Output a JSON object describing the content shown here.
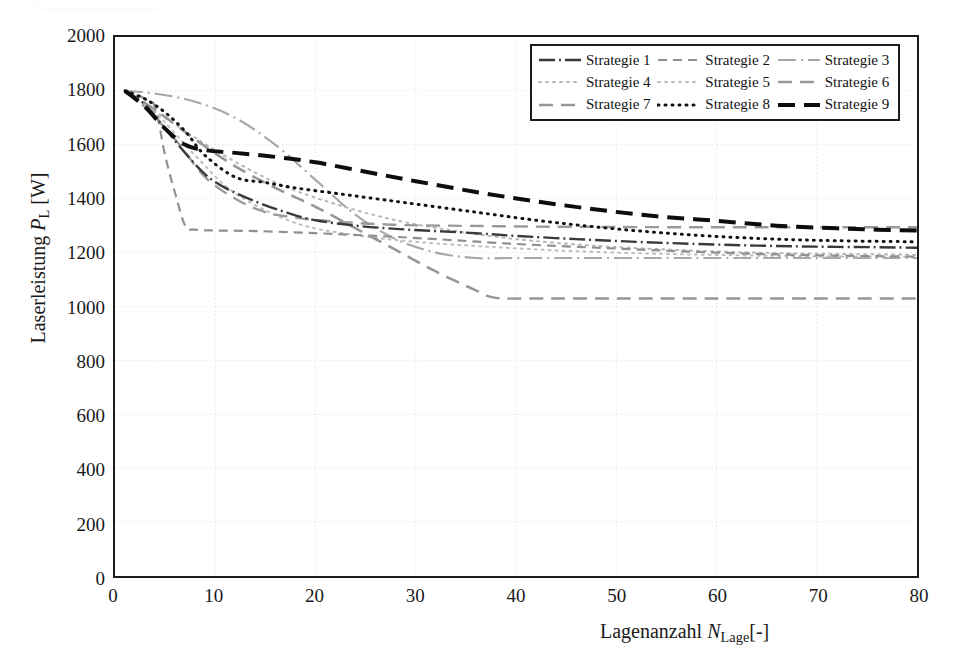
{
  "axes": {
    "y_title_prefix": "Laserleistung ",
    "y_title_symbol": "P",
    "y_title_sub": "L",
    "y_title_suffix": " [W]",
    "x_title_prefix": "Lagenanzahl ",
    "x_title_symbol": "N",
    "x_title_sub": "Lage",
    "x_title_suffix": "[-]",
    "y_ticks": [
      "2000",
      "1800",
      "1600",
      "1400",
      "1200",
      "1000",
      "800",
      "600",
      "400",
      "200",
      "0"
    ],
    "x_ticks": [
      "0",
      "10",
      "20",
      "30",
      "40",
      "50",
      "60",
      "70",
      "80"
    ]
  },
  "legend": {
    "items": [
      {
        "label": "Strategie 1",
        "key": "s1"
      },
      {
        "label": "Strategie 2",
        "key": "s2"
      },
      {
        "label": "Strategie 3",
        "key": "s3"
      },
      {
        "label": "Strategie 4",
        "key": "s4"
      },
      {
        "label": "Strategie 5",
        "key": "s5"
      },
      {
        "label": "Strategie 6",
        "key": "s6"
      },
      {
        "label": "Strategie 7",
        "key": "s7"
      },
      {
        "label": "Strategie 8",
        "key": "s8"
      },
      {
        "label": "Strategie 9",
        "key": "s9"
      }
    ]
  },
  "chart_data": {
    "type": "line",
    "title": "",
    "xlabel": "Lagenanzahl N_Lage [-]",
    "ylabel": "Laserleistung P_L [W]",
    "xlim": [
      0,
      80
    ],
    "ylim": [
      0,
      2000
    ],
    "xticks": [
      0,
      10,
      20,
      30,
      40,
      50,
      60,
      70,
      80
    ],
    "yticks": [
      0,
      200,
      400,
      600,
      800,
      1000,
      1200,
      1400,
      1600,
      1800,
      2000
    ],
    "grid": "dotted-light",
    "legend_position": "top-right-inside",
    "series": [
      {
        "name": "Strategie 1",
        "style": "dash-dot",
        "color": "#3a3a3a",
        "width": 2.4,
        "x": [
          1,
          3,
          5,
          7,
          9,
          11,
          14,
          17,
          20,
          24,
          28,
          32,
          36,
          40,
          46,
          52,
          58,
          64,
          70,
          76,
          80
        ],
        "y": [
          1800,
          1750,
          1660,
          1570,
          1490,
          1440,
          1390,
          1350,
          1320,
          1300,
          1288,
          1280,
          1272,
          1262,
          1250,
          1240,
          1232,
          1226,
          1222,
          1220,
          1218
        ]
      },
      {
        "name": "Strategie 2",
        "style": "dashed",
        "color": "#8f8f8f",
        "width": 2.2,
        "x": [
          1,
          2,
          3,
          4,
          5,
          6,
          7,
          8,
          10,
          14,
          20,
          26,
          32,
          40,
          50,
          60,
          70,
          80
        ],
        "y": [
          1800,
          1790,
          1770,
          1740,
          1560,
          1420,
          1300,
          1285,
          1282,
          1280,
          1272,
          1262,
          1250,
          1232,
          1215,
          1200,
          1190,
          1185
        ]
      },
      {
        "name": "Strategie 3",
        "style": "dash-dot-light",
        "color": "#a8a8a8",
        "width": 2.2,
        "x": [
          1,
          4,
          8,
          12,
          16,
          20,
          24,
          28,
          32,
          36,
          40,
          46,
          52,
          58,
          64,
          70,
          76,
          80
        ],
        "y": [
          1800,
          1790,
          1760,
          1700,
          1600,
          1470,
          1340,
          1250,
          1200,
          1180,
          1180,
          1180,
          1180,
          1180,
          1180,
          1180,
          1180,
          1180
        ]
      },
      {
        "name": "Strategie 4",
        "style": "dotted-light",
        "color": "#b6b6b6",
        "width": 2.0,
        "x": [
          1,
          5,
          10,
          16,
          22,
          28,
          34,
          40,
          48,
          56,
          64,
          72,
          80
        ],
        "y": [
          1800,
          1700,
          1580,
          1460,
          1380,
          1320,
          1280,
          1250,
          1225,
          1210,
          1200,
          1195,
          1192
        ]
      },
      {
        "name": "Strategie 5",
        "style": "dotted-light",
        "color": "#bdbdbd",
        "width": 2.0,
        "x": [
          1,
          4,
          8,
          12,
          18,
          24,
          30,
          38,
          46,
          54,
          62,
          70,
          80
        ],
        "y": [
          1800,
          1720,
          1560,
          1420,
          1310,
          1265,
          1240,
          1220,
          1205,
          1196,
          1190,
          1186,
          1184
        ]
      },
      {
        "name": "Strategie 6",
        "style": "dashed-wide",
        "color": "#9a9a9a",
        "width": 2.4,
        "x": [
          1,
          3,
          6,
          9,
          12,
          15,
          18,
          21,
          25,
          29,
          33,
          38,
          44,
          50,
          58,
          66,
          74,
          80
        ],
        "y": [
          1800,
          1740,
          1620,
          1480,
          1400,
          1350,
          1330,
          1318,
          1308,
          1302,
          1300,
          1298,
          1296,
          1295,
          1294,
          1294,
          1294,
          1294
        ]
      },
      {
        "name": "Strategie 7",
        "style": "dashed-wide",
        "color": "#969696",
        "width": 2.5,
        "x": [
          1,
          4,
          8,
          12,
          16,
          20,
          24,
          28,
          32,
          36,
          38,
          42,
          50,
          60,
          70,
          80
        ],
        "y": [
          1800,
          1730,
          1620,
          1520,
          1440,
          1370,
          1290,
          1210,
          1130,
          1060,
          1032,
          1030,
          1030,
          1030,
          1030,
          1030
        ]
      },
      {
        "name": "Strategie 8",
        "style": "dotted-heavy",
        "color": "#111111",
        "width": 3.0,
        "x": [
          1,
          3,
          5,
          7,
          9,
          12,
          15,
          18,
          22,
          26,
          30,
          36,
          42,
          48,
          54,
          60,
          66,
          72,
          80
        ],
        "y": [
          1800,
          1770,
          1720,
          1650,
          1560,
          1480,
          1460,
          1440,
          1420,
          1400,
          1380,
          1350,
          1320,
          1295,
          1275,
          1260,
          1250,
          1244,
          1240
        ]
      },
      {
        "name": "Strategie 9",
        "style": "dashed-heavy",
        "color": "#0d0d0d",
        "width": 4.0,
        "x": [
          1,
          3,
          5,
          7,
          9,
          12,
          16,
          20,
          25,
          30,
          36,
          42,
          48,
          54,
          60,
          66,
          72,
          76,
          80
        ],
        "y": [
          1800,
          1740,
          1660,
          1600,
          1580,
          1570,
          1555,
          1535,
          1500,
          1465,
          1425,
          1390,
          1360,
          1335,
          1318,
          1300,
          1290,
          1285,
          1282
        ]
      }
    ]
  }
}
